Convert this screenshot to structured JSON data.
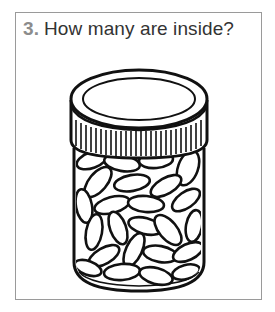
{
  "question": {
    "number": "3.",
    "text": "How many are inside?"
  },
  "illustration": {
    "subject": "jar-of-beans-icon",
    "description": "Clear jar with ridged screw cap, filled with beans",
    "colors": {
      "stroke": "#111111",
      "fill": "#ffffff",
      "border": "#9a9a9a",
      "number": "#8c8c8c",
      "text": "#333333"
    }
  }
}
